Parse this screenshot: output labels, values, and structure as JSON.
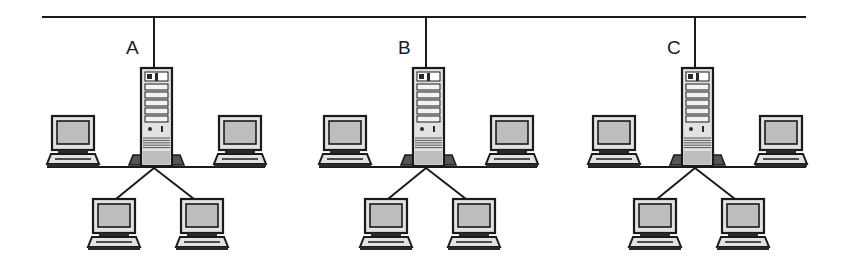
{
  "diagram": {
    "type": "network-topology",
    "colors": {
      "line": "#1a1a1a",
      "fill_light": "#e2e2e2",
      "fill_mid": "#bdbdbd",
      "fill_dark": "#2a2a2a",
      "background": "#ffffff"
    },
    "backbone": {
      "name": "backbone-bus"
    },
    "networks": [
      {
        "label": "A",
        "server": "server-a",
        "clients": [
          "pc-a-left",
          "pc-a-right",
          "pc-a-bottom-left",
          "pc-a-bottom-right"
        ]
      },
      {
        "label": "B",
        "server": "server-b",
        "clients": [
          "pc-b-left",
          "pc-b-right",
          "pc-b-bottom-left",
          "pc-b-bottom-right"
        ]
      },
      {
        "label": "C",
        "server": "server-c",
        "clients": [
          "pc-c-left",
          "pc-c-right",
          "pc-c-bottom-left",
          "pc-c-bottom-right"
        ]
      }
    ]
  }
}
